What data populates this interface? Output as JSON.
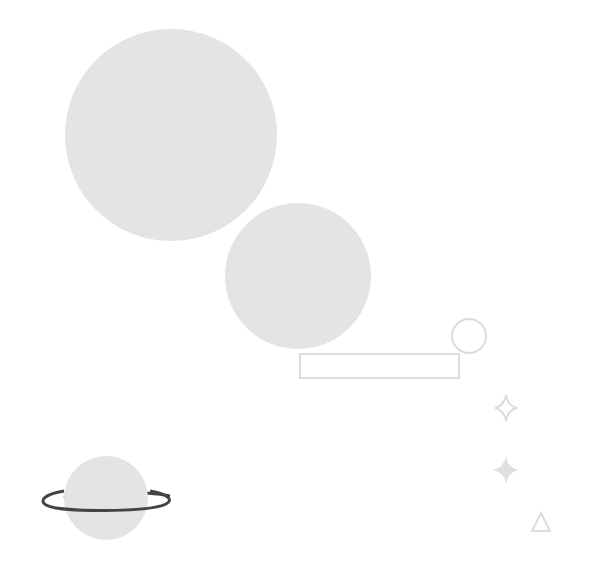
{
  "illustration": {
    "colors": {
      "fill": "#e4e4e4",
      "outline": "#dcdcdc",
      "ring": "#444444",
      "background": "#ffffff"
    },
    "shapes": [
      {
        "type": "circle",
        "name": "large-planet",
        "cx": 171,
        "cy": 135,
        "r": 106
      },
      {
        "type": "circle",
        "name": "medium-planet",
        "cx": 298,
        "cy": 276,
        "r": 73
      },
      {
        "type": "circle-outline",
        "name": "small-moon",
        "cx": 469,
        "cy": 336,
        "r": 17
      },
      {
        "type": "rect-outline",
        "name": "bar",
        "x": 300,
        "y": 354,
        "w": 159,
        "h": 24
      },
      {
        "type": "star-outline",
        "name": "sparkle-outline",
        "cx": 506,
        "cy": 408
      },
      {
        "type": "star-filled",
        "name": "sparkle-filled",
        "cx": 506,
        "cy": 470
      },
      {
        "type": "triangle-outline",
        "name": "triangle",
        "cx": 541,
        "cy": 522
      },
      {
        "type": "ringed-planet",
        "name": "saturn",
        "cx": 106,
        "cy": 498,
        "r": 42
      }
    ]
  }
}
